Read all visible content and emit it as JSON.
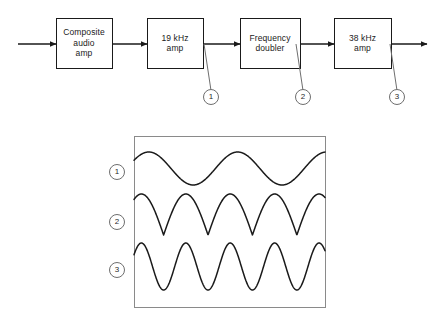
{
  "figure": {
    "line_color": "#1a1a1a",
    "panel_border_color": "#8a8a8a",
    "circle_color": "#6e6e6e",
    "background": "#ffffff"
  },
  "block_diagram": {
    "input_arrow": "input-signal-arrow",
    "output_arrow": "output-signal-arrow",
    "blocks": [
      {
        "id": "composite-audio-amp",
        "lines": [
          "Composite",
          "audio",
          "amp"
        ],
        "x": 56,
        "y": 18,
        "w": 56,
        "h": 50
      },
      {
        "id": "19-khz-amp",
        "lines": [
          "19 kHz",
          "amp"
        ],
        "x": 147,
        "y": 18,
        "w": 56,
        "h": 50
      },
      {
        "id": "frequency-doubler",
        "lines": [
          "Frequency",
          "doubler"
        ],
        "x": 240,
        "y": 18,
        "w": 60,
        "h": 50
      },
      {
        "id": "38-khz-amp",
        "lines": [
          "38 kHz",
          "amp"
        ],
        "x": 334,
        "y": 18,
        "w": 57,
        "h": 50
      }
    ],
    "test_points": [
      {
        "label": "1",
        "cx": 211,
        "cy": 97,
        "r": 7.5,
        "leader_from_x": 204,
        "leader_from_y": 44
      },
      {
        "label": "2",
        "cx": 303,
        "cy": 97,
        "r": 7.5,
        "leader_from_x": 296,
        "leader_from_y": 44
      },
      {
        "label": "3",
        "cx": 397,
        "cy": 97,
        "r": 7.5,
        "leader_from_x": 390,
        "leader_from_y": 44
      }
    ]
  },
  "waveform_panel": {
    "x": 134,
    "y": 136,
    "w": 191,
    "h": 171,
    "labels": [
      {
        "label": "1",
        "cx": 117,
        "cy": 172,
        "r": 7.5
      },
      {
        "label": "2",
        "cx": 117,
        "cy": 222,
        "r": 7.5
      },
      {
        "label": "3",
        "cx": 117,
        "cy": 270,
        "r": 7.5
      }
    ]
  },
  "chart_data": {
    "type": "line",
    "xlabel": "",
    "ylabel": "",
    "grid": false,
    "legend": "left-circled-numbers",
    "x_range": [
      0,
      1
    ],
    "traces": [
      {
        "name": "1",
        "description": "19 kHz sine wave at output of 19 kHz amp",
        "waveform": "sine",
        "cycles": 2.15,
        "phase_deg": 30,
        "amplitude": 1.0,
        "baseline_y": 168,
        "peak_to_peak_px": 33,
        "band_top_y": 152,
        "band_bottom_y": 185
      },
      {
        "name": "2",
        "description": "Full-wave rectified sine at output of frequency doubler",
        "waveform": "rectified-sine",
        "cycles": 4.3,
        "phase_deg": 30,
        "amplitude": 1.0,
        "baseline_y": 214,
        "peak_to_peak_px": 41,
        "band_top_y": 194,
        "band_bottom_y": 235
      },
      {
        "name": "3",
        "description": "38 kHz sine wave at output of 38 kHz amp",
        "waveform": "sine",
        "cycles": 4.3,
        "phase_deg": 30,
        "amplitude": 1.0,
        "baseline_y": 266,
        "peak_to_peak_px": 47,
        "band_top_y": 243,
        "band_bottom_y": 290
      }
    ]
  }
}
